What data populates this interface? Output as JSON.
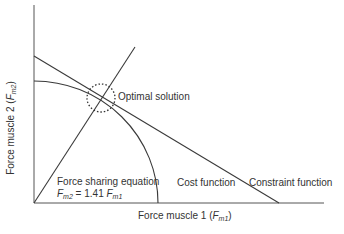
{
  "diagram": {
    "x_axis": {
      "label_prefix": "Force muscle 1 (",
      "symbol": "F",
      "subscript": "m1",
      "label_suffix": ")"
    },
    "y_axis": {
      "label_prefix": "Force muscle 2 (",
      "symbol": "F",
      "subscript": "m2",
      "label_suffix": ")"
    },
    "annotations": {
      "optimal_solution": "Optimal solution",
      "force_sharing_title": "Force sharing equation",
      "force_sharing_eq": {
        "lhs_symbol": "F",
        "lhs_sub": "m2",
        "middle": " = 1.41 ",
        "rhs_symbol": "F",
        "rhs_sub": "m1"
      },
      "cost_function": "Cost function",
      "constraint_function": "Constraint function"
    },
    "colors": {
      "line": "#3a3a3a",
      "text": "#333333",
      "background": "#ffffff"
    }
  }
}
